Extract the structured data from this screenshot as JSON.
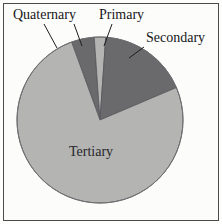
{
  "figure": {
    "background_color": "#fcfcfa",
    "border_color": "#4a4a48"
  },
  "chart_data": {
    "type": "pie",
    "title": "",
    "subtitle": "",
    "xlabel": "",
    "ylabel": "",
    "grid": false,
    "legend_position": "none",
    "label_placement": "outside-with-leader-lines",
    "center": {
      "x": 100,
      "y": 120
    },
    "radius": 83,
    "start_angle_deg": -20,
    "direction": "clockwise",
    "categories": [
      "Quaternary",
      "Primary",
      "Secondary",
      "Tertiary"
    ],
    "values": [
      4.4,
      2.2,
      17.5,
      75.9
    ],
    "units": "percent",
    "colors": [
      "#6a6a6c",
      "#b4b4b2",
      "#6a6a6c",
      "#b4b4b2"
    ],
    "slices": [
      {
        "label": "Quaternary",
        "value": 4.4,
        "color": "#6a6a6c",
        "start_angle_deg": -20,
        "end_angle_deg": -4,
        "leader_line": true,
        "label_inside": false
      },
      {
        "label": "Primary",
        "value": 2.2,
        "color": "#b4b4b2",
        "start_angle_deg": -4,
        "end_angle_deg": 4,
        "leader_line": true,
        "label_inside": false
      },
      {
        "label": "Secondary",
        "value": 17.5,
        "color": "#6a6a6c",
        "start_angle_deg": 4,
        "end_angle_deg": 67,
        "leader_line": true,
        "label_inside": false
      },
      {
        "label": "Tertiary",
        "value": 75.9,
        "color": "#b4b4b2",
        "start_angle_deg": 67,
        "end_angle_deg": 340,
        "leader_line": false,
        "label_inside": true
      }
    ]
  },
  "labels": {
    "quaternary": "Quaternary",
    "primary": "Primary",
    "secondary": "Secondary",
    "tertiary": "Tertiary"
  }
}
